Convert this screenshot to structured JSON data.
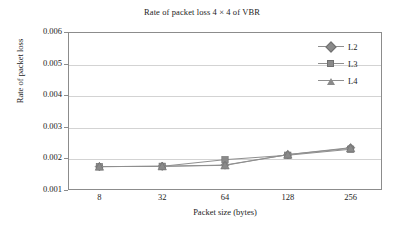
{
  "chart_data": {
    "type": "line",
    "title": "Rate of packet loss 4 × 4 of VBR",
    "xlabel": "Packet size (bytes)",
    "ylabel": "Rate of packet loss",
    "categories": [
      "8",
      "32",
      "64",
      "128",
      "256"
    ],
    "ylim": [
      0.001,
      0.006
    ],
    "ytick_labels": [
      "0.006",
      "0.005",
      "0.004",
      "0.003",
      "0.002",
      "0.001"
    ],
    "ytick_values": [
      0.006,
      0.005,
      0.004,
      0.003,
      0.002,
      0.001
    ],
    "grid": true,
    "legend_position": "top-right-inside",
    "series": [
      {
        "name": "L2",
        "marker": "diamond",
        "color": "#8a8a8a",
        "values": [
          0.00174,
          0.00175,
          0.00179,
          0.00212,
          0.00234
        ]
      },
      {
        "name": "L3",
        "marker": "square",
        "color": "#8a8a8a",
        "values": [
          0.00174,
          0.00175,
          0.00196,
          0.0021,
          0.00229
        ]
      },
      {
        "name": "L4",
        "marker": "triangle",
        "color": "#8a8a8a",
        "values": [
          0.00174,
          0.00175,
          0.00178,
          0.00212,
          0.00232
        ]
      }
    ]
  },
  "legend": {
    "items": [
      {
        "label": "L2"
      },
      {
        "label": "L3"
      },
      {
        "label": "L4"
      }
    ]
  }
}
